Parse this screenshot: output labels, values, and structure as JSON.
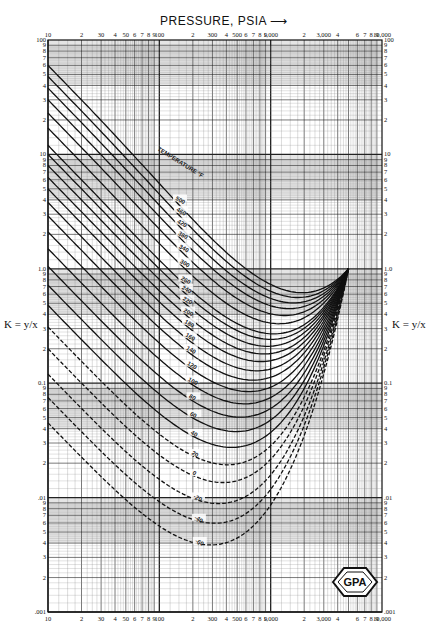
{
  "chart_data": {
    "type": "line",
    "title": "",
    "xlabel": "PRESSURE, PSIA",
    "xlabel_arrow": "⟶",
    "ylabel": "K = y/x",
    "ylabel_right": "K = y/x",
    "x_scale": "log",
    "y_scale": "log",
    "xlim": [
      10,
      10000
    ],
    "ylim": [
      0.001,
      100
    ],
    "grid": true,
    "x_major_ticks_top": [
      "10",
      "2",
      "30",
      "4",
      "50",
      "6",
      "7",
      "8",
      "9",
      "100",
      "2",
      "300",
      "4",
      "500",
      "6",
      "7",
      "8",
      "9",
      "1,000",
      "2",
      "3,000",
      "4",
      "6",
      "7",
      "8",
      "9",
      "10,000"
    ],
    "x_major_ticks_bottom": [
      "10",
      "2",
      "30",
      "4",
      "50",
      "6",
      "7",
      "8",
      "9",
      "100",
      "2",
      "300",
      "4",
      "500",
      "6",
      "7",
      "8",
      "9",
      "1,000",
      "2",
      "3,000",
      "4",
      "6",
      "7",
      "8",
      "9",
      "10,000"
    ],
    "y_decade_labels": [
      "100",
      "10",
      "1.0",
      "0.1",
      ".01",
      ".001"
    ],
    "y_minor_labels": [
      "9",
      "8",
      "7",
      "6",
      "5",
      "4",
      "3",
      "2"
    ],
    "convergence_pressure_psia": 5000,
    "convergence_k": 1.0,
    "temperature_label": "TEMPERATURE °F",
    "series": [
      {
        "name": "500",
        "temp_f": 500,
        "k_at_10psia": 60
      },
      {
        "name": "460",
        "temp_f": 460,
        "k_at_10psia": 48
      },
      {
        "name": "420",
        "temp_f": 420,
        "k_at_10psia": 38
      },
      {
        "name": "380",
        "temp_f": 380,
        "k_at_10psia": 30
      },
      {
        "name": "340",
        "temp_f": 340,
        "k_at_10psia": 23
      },
      {
        "name": "300",
        "temp_f": 300,
        "k_at_10psia": 17
      },
      {
        "name": "260",
        "temp_f": 260,
        "k_at_10psia": 12
      },
      {
        "name": "240",
        "temp_f": 240,
        "k_at_10psia": 10
      },
      {
        "name": "220",
        "temp_f": 220,
        "k_at_10psia": 8
      },
      {
        "name": "200",
        "temp_f": 200,
        "k_at_10psia": 6.3
      },
      {
        "name": "180",
        "temp_f": 180,
        "k_at_10psia": 5
      },
      {
        "name": "160",
        "temp_f": 160,
        "k_at_10psia": 3.8
      },
      {
        "name": "140",
        "temp_f": 140,
        "k_at_10psia": 2.9
      },
      {
        "name": "120",
        "temp_f": 120,
        "k_at_10psia": 2.1
      },
      {
        "name": "100",
        "temp_f": 100,
        "k_at_10psia": 1.5
      },
      {
        "name": "80",
        "temp_f": 80,
        "k_at_10psia": 1.05
      },
      {
        "name": "60",
        "temp_f": 60,
        "k_at_10psia": 0.72
      },
      {
        "name": "40",
        "temp_f": 40,
        "k_at_10psia": 0.48
      },
      {
        "name": "20",
        "temp_f": 20,
        "k_at_10psia": 0.31
      },
      {
        "name": "0",
        "temp_f": 0,
        "k_at_10psia": 0.2
      },
      {
        "name": "-20",
        "temp_f": -20,
        "k_at_10psia": 0.12
      },
      {
        "name": "-40",
        "temp_f": -40,
        "k_at_10psia": 0.075
      },
      {
        "name": "-60",
        "temp_f": -60,
        "k_at_10psia": 0.045
      }
    ],
    "annotations": [
      "GPA"
    ]
  }
}
